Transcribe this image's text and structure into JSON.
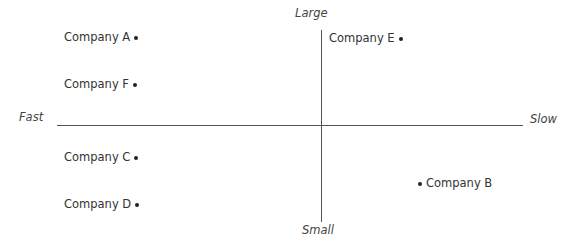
{
  "axes": {
    "top": "Large",
    "bottom": "Small",
    "left": "Fast",
    "right": "Slow"
  },
  "points": [
    {
      "label": "Company A",
      "dot_side": "right"
    },
    {
      "label": "Company F",
      "dot_side": "right"
    },
    {
      "label": "Company E",
      "dot_side": "right"
    },
    {
      "label": "Company C",
      "dot_side": "right"
    },
    {
      "label": "Company D",
      "dot_side": "right"
    },
    {
      "label": "Company B",
      "dot_side": "left"
    }
  ]
}
